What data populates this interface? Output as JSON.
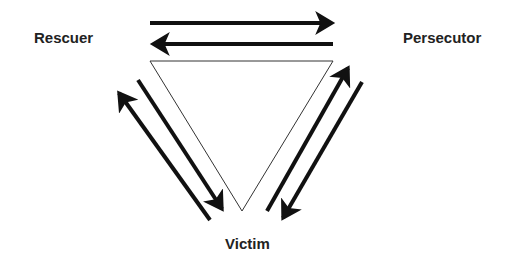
{
  "diagram": {
    "nodes": {
      "rescuer": "Rescuer",
      "persecutor": "Persecutor",
      "victim": "Victim"
    },
    "colors": {
      "background": "#ffffff",
      "stroke": "#111111",
      "text": "#222222"
    },
    "edges": [
      {
        "from": "Rescuer",
        "to": "Persecutor",
        "direction": "rightward arrow (top)"
      },
      {
        "from": "Persecutor",
        "to": "Rescuer",
        "direction": "leftward arrow (bottom)"
      },
      {
        "from": "Victim",
        "to": "Rescuer",
        "direction": "arrow up-left (outer)"
      },
      {
        "from": "Rescuer",
        "to": "Victim",
        "direction": "arrow down-right (inner)"
      },
      {
        "from": "Victim",
        "to": "Persecutor",
        "direction": "arrow up-right (inner)"
      },
      {
        "from": "Persecutor",
        "to": "Victim",
        "direction": "arrow down-left (outer)"
      }
    ]
  }
}
